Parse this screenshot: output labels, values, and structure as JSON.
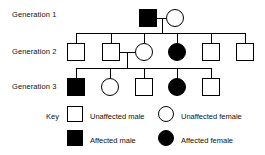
{
  "diagram": {
    "stroke_color": "#000000",
    "affected_fill": "#000000",
    "unaffected_fill": "#ffffff",
    "background": "#ffffff"
  },
  "generations": [
    {
      "id": "generation-1",
      "label": "Generation 1",
      "label_x": 12,
      "label_y": 11,
      "row_y": 9,
      "members": [
        {
          "id": "g1-i1",
          "shape": "square",
          "sex": "male",
          "status": "affected",
          "x": 139,
          "y": 9,
          "size": 18
        },
        {
          "id": "g1-i2",
          "shape": "circle",
          "sex": "female",
          "status": "unaffected",
          "x": 166,
          "y": 9,
          "size": 18
        }
      ]
    },
    {
      "id": "generation-2",
      "label": "Generation 2",
      "label_x": 12,
      "label_y": 48,
      "row_y": 43,
      "members": [
        {
          "id": "g2-i1",
          "shape": "square",
          "sex": "male",
          "status": "unaffected",
          "x": 67,
          "y": 43,
          "size": 18
        },
        {
          "id": "g2-i2",
          "shape": "square",
          "sex": "male",
          "status": "unaffected",
          "x": 102,
          "y": 43,
          "size": 18
        },
        {
          "id": "g2-i3",
          "shape": "circle",
          "sex": "female",
          "status": "unaffected",
          "x": 135,
          "y": 43,
          "size": 18
        },
        {
          "id": "g2-i4",
          "shape": "circle",
          "sex": "female",
          "status": "affected",
          "x": 168,
          "y": 43,
          "size": 18
        },
        {
          "id": "g2-i5",
          "shape": "square",
          "sex": "male",
          "status": "unaffected",
          "x": 202,
          "y": 43,
          "size": 18
        },
        {
          "id": "g2-i6",
          "shape": "square",
          "sex": "male",
          "status": "unaffected",
          "x": 236,
          "y": 43,
          "size": 18
        }
      ]
    },
    {
      "id": "generation-3",
      "label": "Generation 3",
      "label_x": 12,
      "label_y": 83,
      "row_y": 78,
      "members": [
        {
          "id": "g3-i1",
          "shape": "square",
          "sex": "male",
          "status": "affected",
          "x": 67,
          "y": 78,
          "size": 18
        },
        {
          "id": "g3-i2",
          "shape": "circle",
          "sex": "female",
          "status": "unaffected",
          "x": 101,
          "y": 78,
          "size": 18
        },
        {
          "id": "g3-i3",
          "shape": "square",
          "sex": "male",
          "status": "unaffected",
          "x": 135,
          "y": 78,
          "size": 18
        },
        {
          "id": "g3-i4",
          "shape": "circle",
          "sex": "female",
          "status": "affected",
          "x": 168,
          "y": 78,
          "size": 18
        },
        {
          "id": "g3-i5",
          "shape": "square",
          "sex": "male",
          "status": "unaffected",
          "x": 202,
          "y": 78,
          "size": 18
        }
      ]
    }
  ],
  "key": {
    "label": "Key",
    "label_x": 46,
    "label_y": 113,
    "entries": [
      {
        "id": "key-unaffected-male",
        "text": "Unaffected male",
        "shape": "square",
        "status": "unaffected",
        "symbol_x": 67,
        "symbol_y": 106,
        "symbol_size": 16,
        "text_x": 90,
        "text_y": 113
      },
      {
        "id": "key-unaffected-female",
        "text": "Unaffected female",
        "shape": "circle",
        "status": "unaffected",
        "symbol_x": 158,
        "symbol_y": 106,
        "symbol_size": 16,
        "text_x": 181,
        "text_y": 113
      },
      {
        "id": "key-affected-male",
        "text": "Affected male",
        "shape": "square",
        "status": "affected",
        "symbol_x": 67,
        "symbol_y": 130,
        "symbol_size": 16,
        "text_x": 90,
        "text_y": 137
      },
      {
        "id": "key-affected-female",
        "text": "Affected female",
        "shape": "circle",
        "status": "affected",
        "symbol_x": 158,
        "symbol_y": 130,
        "symbol_size": 16,
        "text_x": 181,
        "text_y": 137
      }
    ]
  },
  "connectors": {
    "couple_gen1": {
      "id": "mating-line-gen1",
      "x1": 157,
      "x2": 166,
      "y": 18
    },
    "gen1_drop": {
      "id": "gen1-descent-line",
      "x": 161.5,
      "y1": 18,
      "y2": 33
    },
    "gen2_sibship": {
      "id": "gen2-sibship-line",
      "x1": 76,
      "x2": 245,
      "y": 33
    },
    "gen2_stems": [
      {
        "id": "gen2-stem-1",
        "x": 76,
        "y1": 33,
        "y2": 43
      },
      {
        "id": "gen2-stem-2",
        "x": 111,
        "y1": 33,
        "y2": 43
      },
      {
        "id": "gen2-stem-3",
        "x": 144,
        "y1": 33,
        "y2": 43
      },
      {
        "id": "gen2-stem-4",
        "x": 177,
        "y1": 33,
        "y2": 43
      },
      {
        "id": "gen2-stem-5",
        "x": 211,
        "y1": 33,
        "y2": 43
      },
      {
        "id": "gen2-stem-6",
        "x": 245,
        "y1": 33,
        "y2": 43
      }
    ],
    "couple_gen2": {
      "id": "mating-line-gen2",
      "x1": 120,
      "x2": 135,
      "y": 52
    },
    "gen2_drop": {
      "id": "gen2-descent-line",
      "x": 127,
      "y1": 52,
      "y2": 68
    },
    "gen3_sibship": {
      "id": "gen3-sibship-line",
      "x1": 76,
      "x2": 211,
      "y": 68
    },
    "gen3_stems": [
      {
        "id": "gen3-stem-1",
        "x": 76,
        "y1": 68,
        "y2": 78
      },
      {
        "id": "gen3-stem-2",
        "x": 110,
        "y1": 68,
        "y2": 78
      },
      {
        "id": "gen3-stem-3",
        "x": 144,
        "y1": 68,
        "y2": 78
      },
      {
        "id": "gen3-stem-4",
        "x": 177,
        "y1": 68,
        "y2": 78
      },
      {
        "id": "gen3-stem-5",
        "x": 211,
        "y1": 68,
        "y2": 78
      }
    ]
  }
}
